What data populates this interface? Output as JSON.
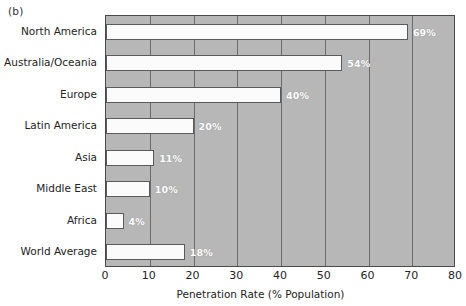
{
  "figure": {
    "panel_letter": "(b)"
  },
  "chart_data": {
    "type": "bar",
    "orientation": "horizontal",
    "title": "",
    "subtitle": "",
    "xlabel": "Penetration Rate (% Population)",
    "ylabel": "",
    "categories": [
      "North America",
      "Australia/Oceania",
      "Europe",
      "Latin America",
      "Asia",
      "Middle East",
      "Africa",
      "World Average"
    ],
    "values": [
      69,
      54,
      40,
      20,
      11,
      10,
      4,
      18
    ],
    "value_labels": [
      "69%",
      "54%",
      "40%",
      "20%",
      "11%",
      "10%",
      "4%",
      "18%"
    ],
    "xlim": [
      0,
      80
    ],
    "xticks": [
      0,
      10,
      20,
      30,
      40,
      50,
      60,
      70,
      80
    ],
    "xtick_labels": [
      "0",
      "10",
      "20",
      "30",
      "40",
      "50",
      "60",
      "70",
      "80"
    ],
    "grid": "vertical",
    "legend": "none",
    "colors": {
      "plot_background": "#b7b7b7",
      "bar_fill": "#fbfbfb",
      "bar_edge": "#5a5a5a",
      "gridline": "#6b6b6b",
      "axis": "#4a4a4a",
      "value_label_text": "#ffffff",
      "text": "#232323"
    }
  }
}
